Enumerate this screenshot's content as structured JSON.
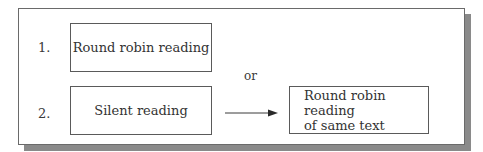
{
  "diagram": {
    "items": [
      {
        "number": "1.",
        "label": "Round robin reading"
      },
      {
        "number": "2.",
        "label": "Silent reading"
      }
    ],
    "connector_label": "or",
    "result_box": {
      "line1": "Round robin reading",
      "line2": "of same text"
    },
    "colors": {
      "border": "#5a5a5a",
      "shadow": "#8a8a8a",
      "text": "#333333"
    }
  }
}
